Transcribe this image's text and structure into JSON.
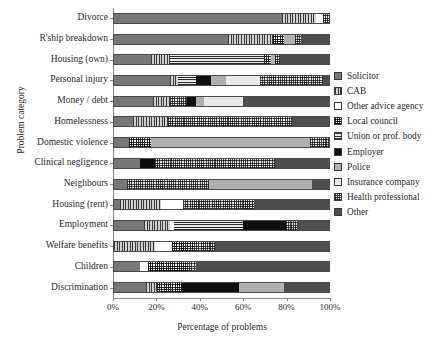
{
  "chart_data": {
    "type": "bar",
    "orientation": "horizontal",
    "stacked": true,
    "title": "",
    "xlabel": "Percentage of problems",
    "ylabel": "Problem category",
    "xlim": [
      0,
      100
    ],
    "xticks": [
      0,
      20,
      40,
      60,
      80,
      100
    ],
    "xtick_labels": [
      "0%",
      "20%",
      "40%",
      "60%",
      "80%",
      "100%"
    ],
    "grid": false,
    "legend_position": "right",
    "legend_entries": [
      "Solicitor",
      "CAB",
      "Other advice agency",
      "Local council",
      "Union or prof. body",
      "Employer",
      "Police",
      "Insurance company",
      "Health professional",
      "Other"
    ],
    "legend_keys": [
      "solicitor",
      "cab",
      "otheradvice",
      "localcouncil",
      "union",
      "employer",
      "police",
      "insurance",
      "health",
      "other"
    ],
    "categories": [
      "Divorce",
      "R'ship breakdown",
      "Housing (own)",
      "Personal injury",
      "Money / debt",
      "Homelessness",
      "Domestic violence",
      "Clinical negligence",
      "Neighbours",
      "Housing (rent)",
      "Employment",
      "Welfare benefits",
      "Children",
      "Discrimination"
    ],
    "series": [
      {
        "name": "Solicitor",
        "key": "solicitor",
        "values": [
          78,
          53,
          17,
          26,
          18,
          9,
          7,
          12,
          6,
          3,
          14,
          0,
          12,
          15
        ]
      },
      {
        "name": "CAB",
        "key": "cab",
        "values": [
          16,
          0,
          9,
          4,
          8,
          16,
          0,
          0,
          0,
          19,
          12,
          19,
          0,
          5
        ]
      },
      {
        "name": "Other advice agency",
        "key": "otheradvice",
        "values": [
          3,
          0,
          0,
          0,
          0,
          0,
          0,
          0,
          0,
          10,
          2,
          8,
          4,
          0
        ]
      },
      {
        "name": "Local council",
        "key": "localcouncil",
        "values": [
          0,
          0,
          0,
          0,
          0,
          0,
          10,
          0,
          0,
          0,
          0,
          0,
          22,
          0
        ]
      },
      {
        "name": "Union or prof. body",
        "key": "union",
        "values": [
          0,
          21,
          44,
          8,
          0,
          0,
          0,
          0,
          0,
          0,
          32,
          0,
          0,
          0
        ]
      },
      {
        "name": "Employer",
        "key": "employer",
        "values": [
          0,
          0,
          0,
          7,
          4,
          0,
          0,
          7,
          0,
          0,
          20,
          0,
          0,
          27
        ]
      },
      {
        "name": "Police",
        "key": "police",
        "values": [
          0,
          5,
          2,
          7,
          0,
          0,
          74,
          0,
          48,
          0,
          0,
          0,
          0,
          21
        ]
      },
      {
        "name": "Insurance company",
        "key": "insurance",
        "values": [
          0,
          0,
          0,
          16,
          18,
          0,
          0,
          0,
          0,
          0,
          0,
          0,
          0,
          0
        ]
      },
      {
        "name": "Health professional",
        "key": "health",
        "values": [
          3,
          5,
          5,
          29,
          0,
          58,
          9,
          56,
          0,
          29,
          5,
          20,
          0,
          0
        ]
      },
      {
        "name": "Other",
        "key": "other",
        "values": [
          0,
          16,
          23,
          3,
          52,
          17,
          0,
          25,
          46,
          39,
          15,
          53,
          62,
          32
        ]
      }
    ],
    "stacks": [
      {
        "category": "Divorce",
        "segments": [
          [
            "solicitor",
            78
          ],
          [
            "cab",
            16
          ],
          [
            "otheradvice",
            3
          ],
          [
            "health",
            3
          ]
        ]
      },
      {
        "category": "R'ship breakdown",
        "segments": [
          [
            "solicitor",
            53
          ],
          [
            "cab",
            21
          ],
          [
            "localcouncil",
            5
          ],
          [
            "police",
            5
          ],
          [
            "health",
            3
          ],
          [
            "other",
            13
          ]
        ]
      },
      {
        "category": "Housing (own)",
        "segments": [
          [
            "solicitor",
            17
          ],
          [
            "cab",
            9
          ],
          [
            "union",
            44
          ],
          [
            "localcouncil",
            3
          ],
          [
            "police",
            2
          ],
          [
            "health",
            2
          ],
          [
            "other",
            23
          ]
        ]
      },
      {
        "category": "Personal injury",
        "segments": [
          [
            "solicitor",
            26
          ],
          [
            "cab",
            4
          ],
          [
            "union",
            8
          ],
          [
            "employer",
            7
          ],
          [
            "police",
            7
          ],
          [
            "insurance",
            16
          ],
          [
            "health",
            29
          ],
          [
            "other",
            3
          ]
        ]
      },
      {
        "category": "Money / debt",
        "segments": [
          [
            "solicitor",
            18
          ],
          [
            "cab",
            8
          ],
          [
            "health",
            8
          ],
          [
            "employer",
            4
          ],
          [
            "police",
            4
          ],
          [
            "insurance",
            18
          ],
          [
            "other",
            40
          ]
        ]
      },
      {
        "category": "Homelessness",
        "segments": [
          [
            "solicitor",
            9
          ],
          [
            "cab",
            16
          ],
          [
            "health",
            58
          ],
          [
            "other",
            17
          ]
        ]
      },
      {
        "category": "Domestic violence",
        "segments": [
          [
            "solicitor",
            7
          ],
          [
            "localcouncil",
            10
          ],
          [
            "police",
            74
          ],
          [
            "health",
            9
          ]
        ]
      },
      {
        "category": "Clinical negligence",
        "segments": [
          [
            "solicitor",
            12
          ],
          [
            "employer",
            7
          ],
          [
            "health",
            56
          ],
          [
            "other",
            25
          ]
        ]
      },
      {
        "category": "Neighbours",
        "segments": [
          [
            "solicitor",
            6
          ],
          [
            "health",
            38
          ],
          [
            "police",
            48
          ],
          [
            "other",
            8
          ]
        ]
      },
      {
        "category": "Housing (rent)",
        "segments": [
          [
            "solicitor",
            3
          ],
          [
            "cab",
            19
          ],
          [
            "otheradvice",
            10
          ],
          [
            "health",
            29
          ],
          [
            "localcouncil",
            4
          ],
          [
            "other",
            35
          ]
        ]
      },
      {
        "category": "Employment",
        "segments": [
          [
            "solicitor",
            14
          ],
          [
            "cab",
            12
          ],
          [
            "otheradvice",
            2
          ],
          [
            "union",
            32
          ],
          [
            "employer",
            20
          ],
          [
            "health",
            5
          ],
          [
            "other",
            15
          ]
        ]
      },
      {
        "category": "Welfare benefits",
        "segments": [
          [
            "cab",
            19
          ],
          [
            "otheradvice",
            8
          ],
          [
            "localcouncil",
            10
          ],
          [
            "health",
            10
          ],
          [
            "other",
            53
          ]
        ]
      },
      {
        "category": "Children",
        "segments": [
          [
            "solicitor",
            12
          ],
          [
            "otheradvice",
            4
          ],
          [
            "localcouncil",
            18
          ],
          [
            "health",
            4
          ],
          [
            "other",
            62
          ]
        ]
      },
      {
        "category": "Discrimination",
        "segments": [
          [
            "solicitor",
            15
          ],
          [
            "cab",
            5
          ],
          [
            "localcouncil",
            11
          ],
          [
            "employer",
            27
          ],
          [
            "police",
            21
          ],
          [
            "other",
            21
          ]
        ]
      }
    ]
  }
}
